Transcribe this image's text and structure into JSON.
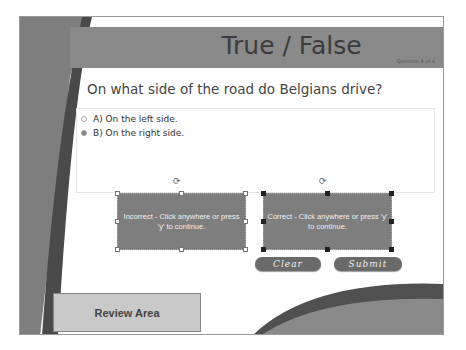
{
  "slide": {
    "title": "True / False",
    "question_counter": "Question 4 of 4",
    "question": "On what side of the road do Belgians drive?",
    "answers": [
      {
        "label": "A) On the left side.",
        "selected": false
      },
      {
        "label": "B) On the right side.",
        "selected": true
      }
    ]
  },
  "feedback": {
    "incorrect": "Incorrect - Click anywhere or press 'y' to continue.",
    "correct": "Correct - Click anywhere or press 'y' to continue."
  },
  "buttons": {
    "clear": "Clear",
    "submit": "Submit"
  },
  "review_area": "Review Area",
  "colors": {
    "band_dark": "#5a5a5a",
    "band_mid": "#8a8a8a",
    "feedback_bg": "#7e7e7e",
    "button_bg": "#6a6a6a"
  }
}
